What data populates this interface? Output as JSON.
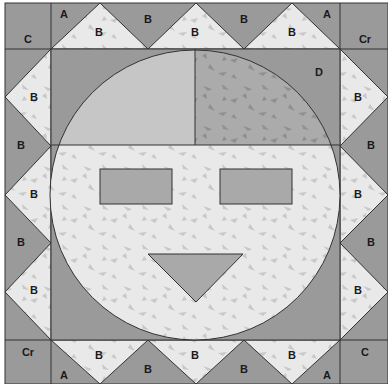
{
  "colors": {
    "dark": "#9a9a9a",
    "light": "#e9e9e9",
    "medium": "#c6c6c6",
    "mottled": "#a9a9a9",
    "speck": "#c8c8c8",
    "line": "#333333"
  },
  "labels": {
    "corner_tl": "C",
    "corner_tr": "Cr",
    "corner_bl": "Cr",
    "corner_br": "C",
    "a_top_left": "A",
    "a_top_right": "A",
    "a_bottom_left": "A",
    "a_bottom_right": "A",
    "top_light": [
      "B",
      "B",
      "B"
    ],
    "top_dark": [
      "B",
      "B"
    ],
    "bottom_light": [
      "B",
      "B",
      "B"
    ],
    "bottom_dark": [
      "B",
      "B"
    ],
    "left_light": [
      "B",
      "B",
      "B"
    ],
    "left_dark": [
      "B",
      "B"
    ],
    "right_light": [
      "B",
      "B",
      "B"
    ],
    "right_dark": [
      "B",
      "B"
    ],
    "center_corner": "D"
  }
}
